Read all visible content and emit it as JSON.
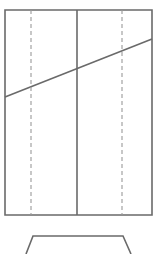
{
  "canvas": {
    "width": 159,
    "height": 254,
    "background": "#ffffff",
    "title": "Elevation line drawing with sill bracket"
  },
  "style": {
    "stroke_color": "#6a6a6a",
    "stroke_color_light": "#9a9a9a",
    "stroke_width": 1.6,
    "dash_pattern": "4 3",
    "fill": "none"
  },
  "chart_data": {
    "type": "diagram",
    "title": "Elevation line drawing with sill bracket",
    "xlabel": "",
    "ylabel": "",
    "xlim": [
      0,
      159
    ],
    "ylim": [
      0,
      254
    ],
    "grid": false,
    "legend": "none",
    "shapes": [
      {
        "name": "outer-rectangle",
        "kind": "polygon",
        "closed": true,
        "stroke": "#6a6a6a",
        "dashed": false,
        "points": [
          [
            5,
            10
          ],
          [
            152,
            10
          ],
          [
            152,
            215
          ],
          [
            5,
            215
          ]
        ]
      },
      {
        "name": "diagonal-slope-line",
        "kind": "polyline",
        "closed": false,
        "stroke": "#6a6a6a",
        "dashed": false,
        "points": [
          [
            5,
            97
          ],
          [
            152,
            39
          ]
        ]
      },
      {
        "name": "center-vertical-divider",
        "kind": "polyline",
        "closed": false,
        "stroke": "#6a6a6a",
        "dashed": false,
        "points": [
          [
            77,
            10
          ],
          [
            77,
            215
          ]
        ]
      },
      {
        "name": "left-dashed-vertical",
        "kind": "polyline",
        "closed": false,
        "stroke": "#9a9a9a",
        "dashed": true,
        "points": [
          [
            31,
            10
          ],
          [
            31,
            215
          ]
        ]
      },
      {
        "name": "right-dashed-vertical",
        "kind": "polyline",
        "closed": false,
        "stroke": "#9a9a9a",
        "dashed": true,
        "points": [
          [
            122,
            10
          ],
          [
            122,
            215
          ]
        ]
      },
      {
        "name": "sill-bracket-trapezoid",
        "kind": "polyline",
        "closed": false,
        "stroke": "#6a6a6a",
        "dashed": false,
        "points": [
          [
            26,
            254
          ],
          [
            33,
            236
          ],
          [
            123,
            236
          ],
          [
            131,
            254
          ]
        ]
      }
    ]
  }
}
